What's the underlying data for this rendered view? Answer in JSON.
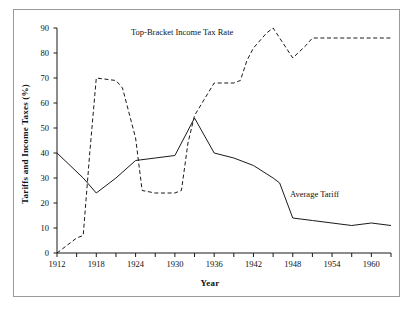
{
  "figure": {
    "width": 413,
    "height": 315,
    "background": "#ffffff",
    "frame_color": "#9a9a9a",
    "line_color": "#1a1a1a"
  },
  "chart_data": {
    "type": "line",
    "title": "",
    "xlabel": "Year",
    "ylabel": "Tariffs and Income Taxes (%)",
    "xlim": [
      1912,
      1963
    ],
    "ylim": [
      0,
      90
    ],
    "yticks": [
      0,
      10,
      20,
      30,
      40,
      50,
      60,
      70,
      80,
      90
    ],
    "ytick_labels": [
      "0",
      "10",
      "20",
      "30",
      "40",
      "50",
      "60",
      "70",
      "80",
      "90"
    ],
    "xticks": [
      1912,
      1918,
      1924,
      1930,
      1936,
      1942,
      1948,
      1954,
      1960
    ],
    "xtick_labels": [
      "1912",
      "1918",
      "1924",
      "1930",
      "1936",
      "1942",
      "1948",
      "1954",
      "1960"
    ],
    "xminor_ticks": [
      1915,
      1921,
      1927,
      1933,
      1939,
      1945,
      1951,
      1957,
      1963
    ],
    "grid": false,
    "legend_position": "inline-annotations",
    "series": [
      {
        "name": "Top-Bracket Income Tax Rate",
        "style": "dashed",
        "annotation_label": "Top-Bracket Income Tax Rate",
        "x": [
          1912,
          1915,
          1916,
          1917,
          1918,
          1921,
          1922,
          1924,
          1925,
          1927,
          1930,
          1931,
          1932,
          1933,
          1936,
          1939,
          1940,
          1941,
          1942,
          1944,
          1945,
          1946,
          1948,
          1950,
          1951,
          1954,
          1960,
          1963
        ],
        "values": [
          0,
          6,
          7,
          40,
          70,
          69,
          66,
          46,
          25,
          24,
          24,
          25,
          44,
          55,
          68,
          68,
          69,
          77,
          82,
          88,
          90,
          86,
          78,
          83,
          86,
          86,
          86,
          86
        ]
      },
      {
        "name": "Average Tariff",
        "style": "solid",
        "annotation_label": "Average Tariff",
        "x": [
          1912,
          1916,
          1918,
          1921,
          1924,
          1927,
          1930,
          1931,
          1933,
          1936,
          1939,
          1942,
          1945,
          1946,
          1948,
          1951,
          1954,
          1957,
          1960,
          1963
        ],
        "values": [
          40,
          30,
          24,
          30,
          37,
          38,
          39,
          44,
          54,
          40,
          38,
          35,
          30,
          28,
          14,
          13,
          12,
          11,
          12,
          11
        ]
      }
    ]
  },
  "annotations": {
    "tax_rate_label": "Top-Bracket Income Tax Rate",
    "tariff_label": "Average Tariff"
  }
}
